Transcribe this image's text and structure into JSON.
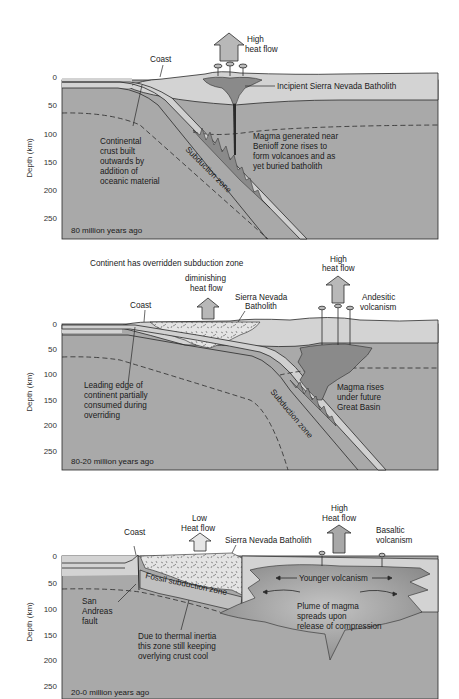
{
  "diagram": {
    "colors": {
      "crust": "#d3d3d3",
      "mantle": "#a9a9a9",
      "slab": "#d0d0d0",
      "magma": "#8a8a8a",
      "batholith": "#e2e2e2",
      "arrow": "#b8b8b8",
      "outline": "#2a2a2a"
    },
    "y_axis_label": "Depth (km)",
    "y_ticks": [
      "0",
      "50",
      "100",
      "150",
      "200",
      "250"
    ],
    "panels": [
      {
        "age": "80 million years ago",
        "labels": {
          "coast": "Coast",
          "heat_flow_1": "High",
          "heat_flow_2": "heat flow",
          "batholith": "Incipient Sierra Nevada Batholith",
          "crust_1": "Continental",
          "crust_2": "crust built",
          "crust_3": "outwards by",
          "crust_4": "addition of",
          "crust_5": "oceanic material",
          "magma_1": "Magma generated near",
          "magma_2": "Benioff zone rises to",
          "magma_3": "form volcanoes and as",
          "magma_4": "yet buried batholith",
          "subduction": "Subduction zone"
        }
      },
      {
        "age": "80-20 million years ago",
        "labels": {
          "title": "Continent has overridden subduction zone",
          "dim_heat_1": "diminishing",
          "dim_heat_2": "heat flow",
          "coast": "Coast",
          "batholith_1": "Sierra Nevada",
          "batholith_2": "Batholith",
          "high_heat_1": "High",
          "high_heat_2": "heat flow",
          "volc_1": "Andesitic",
          "volc_2": "volcanism",
          "edge_1": "Leading edge of",
          "edge_2": "continent partially",
          "edge_3": "consumed during",
          "edge_4": "overriding",
          "magma_1": "Magma rises",
          "magma_2": "under future",
          "magma_3": "Great Basin",
          "subduction": "Subduction zone"
        }
      },
      {
        "age": "20-0 million years ago",
        "labels": {
          "coast": "Coast",
          "low_heat_1": "Low",
          "low_heat_2": "Heat flow",
          "batholith": "Sierra Nevada Batholith",
          "high_heat_1": "High",
          "high_heat_2": "Heat flow",
          "volc_1": "Basaltic",
          "volc_2": "volcanism",
          "younger": "Younger volcanism",
          "fossil": "Fossil subduction zone",
          "fault_1": "San",
          "fault_2": "Andreas",
          "fault_3": "fault",
          "plume_1": "Plume of magma",
          "plume_2": "spreads upon",
          "plume_3": "release of compression",
          "inertia_1": "Due to thermal inertia",
          "inertia_2": "this zone still keeping",
          "inertia_3": "overlying crust cool"
        }
      }
    ]
  }
}
